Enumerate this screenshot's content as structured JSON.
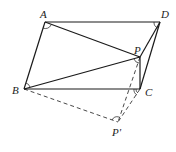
{
  "diagram": {
    "points": {
      "A": {
        "label": "A",
        "x": 45,
        "y": 22
      },
      "D": {
        "label": "D",
        "x": 160,
        "y": 22
      },
      "B": {
        "label": "B",
        "x": 24,
        "y": 89
      },
      "C": {
        "label": "C",
        "x": 140,
        "y": 89
      },
      "P": {
        "label": "P",
        "x": 140,
        "y": 57
      },
      "P_prime": {
        "label": "P'",
        "x": 118,
        "y": 122
      }
    },
    "solid_segments": [
      "AD",
      "AB",
      "BC",
      "CD",
      "AP",
      "PD",
      "BP",
      "PC"
    ],
    "dashed_segments": [
      "BP'",
      "PP'",
      "CP'"
    ],
    "angle_marks": [
      "A",
      "D",
      "B",
      "P",
      "C",
      "P'"
    ],
    "colors": {
      "stroke": "#1a1a1a",
      "background": "#ffffff"
    }
  }
}
